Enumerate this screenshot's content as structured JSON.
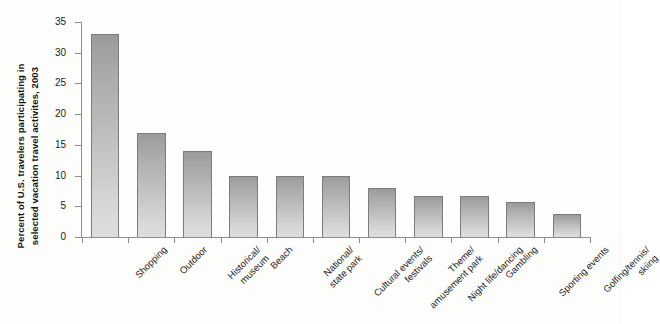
{
  "chart_data": {
    "type": "bar",
    "title": "",
    "subtitle": "",
    "xlabel": "",
    "ylabel": "Percent of U.S. travelers participating in selected vacation travel activites, 2003",
    "ylabel_lines": [
      "Percent of U.S. travelers participating in",
      "selected vacation travel activites, 2003"
    ],
    "ylim": [
      0,
      35
    ],
    "yticks": [
      0,
      5,
      10,
      15,
      20,
      25,
      30,
      35
    ],
    "ytick_labels": [
      "0",
      "5",
      "10",
      "15",
      "20",
      "25",
      "30",
      "35"
    ],
    "grid": false,
    "legend": false,
    "legend_position": "none",
    "categories": [
      "Shopping",
      "Outdoor",
      "Historical/ museum",
      "Beach",
      "National/ state park",
      "Cultural events/ festivals",
      "Theme/ amusement park",
      "Night life/dancing",
      "Gambling",
      "Sporting events",
      "Golfing/tennis/ skiing"
    ],
    "category_label_lines": [
      [
        "Shopping"
      ],
      [
        "Outdoor"
      ],
      [
        "Historical/",
        "museum"
      ],
      [
        "Beach"
      ],
      [
        "National/",
        "state park"
      ],
      [
        "Cultural events/",
        "festivals"
      ],
      [
        "Theme/",
        "amusement park"
      ],
      [
        "Night life/dancing"
      ],
      [
        "Gambling"
      ],
      [
        "Sporting events"
      ],
      [
        "Golfing/tennis/",
        "skiing"
      ]
    ],
    "values": [
      33,
      17,
      14,
      10,
      10,
      10,
      8,
      6.7,
      6.7,
      5.7,
      3.8
    ],
    "bar_fill_top_color": "#9b9b9b",
    "bar_fill_bottom_color": "#dedede",
    "bar_border_color": "#7c7c7c",
    "axis_color": "#8d8d8d",
    "background_color": "#fdfdfc"
  }
}
